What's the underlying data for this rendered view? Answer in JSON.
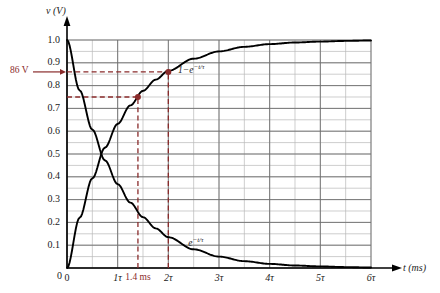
{
  "chart_data": {
    "type": "line",
    "title": "",
    "xlabel": "t (ms)",
    "ylabel": "v (V)",
    "xlim": [
      0,
      6
    ],
    "ylim": [
      0,
      1.0
    ],
    "grid": true,
    "grid_major_x": 1,
    "grid_minor_x": 0.5,
    "grid_major_y": 0.1,
    "grid_minor_y": 0.05,
    "x_unit": "tau",
    "xticks": [
      "0",
      "1τ",
      "2τ",
      "3τ",
      "4τ",
      "5τ",
      "6τ"
    ],
    "xtick_values": [
      0,
      1,
      2,
      3,
      4,
      5,
      6
    ],
    "yticks": [
      "0",
      "0.1",
      "0.2",
      "0.3",
      "0.4",
      "0.5",
      "0.6",
      "0.7",
      "0.8",
      "0.9",
      "1.0"
    ],
    "ytick_values": [
      0,
      0.1,
      0.2,
      0.3,
      0.4,
      0.5,
      0.6,
      0.7,
      0.8,
      0.9,
      1.0
    ],
    "legend_position": "inline-annotation",
    "series": [
      {
        "name": "1 - e^(-t/tau)",
        "label": "1−e",
        "label_exponent": "−t/τ",
        "label_x": 2.35,
        "label_y": 0.875,
        "formula": "1 - exp(-t/tau)",
        "x": [
          0,
          0.25,
          0.5,
          0.75,
          1,
          1.25,
          1.5,
          1.75,
          2,
          2.5,
          3,
          3.5,
          4,
          4.5,
          5,
          5.5,
          6
        ],
        "values": [
          0,
          0.221,
          0.393,
          0.528,
          0.632,
          0.713,
          0.777,
          0.826,
          0.865,
          0.918,
          0.95,
          0.97,
          0.982,
          0.989,
          0.993,
          0.996,
          0.998
        ]
      },
      {
        "name": "e^(-t/tau)",
        "label": "e",
        "label_exponent": "−t/τ",
        "label_x": 2.55,
        "label_y": 0.115,
        "formula": "exp(-t/tau)",
        "x": [
          0,
          0.25,
          0.5,
          0.75,
          1,
          1.25,
          1.5,
          1.75,
          2,
          2.5,
          3,
          3.5,
          4,
          4.5,
          5,
          5.5,
          6
        ],
        "values": [
          1,
          0.779,
          0.607,
          0.472,
          0.368,
          0.287,
          0.223,
          0.174,
          0.135,
          0.082,
          0.05,
          0.03,
          0.018,
          0.011,
          0.007,
          0.004,
          0.002
        ]
      }
    ],
    "markers": [
      {
        "name": "point-1.4ms",
        "x": 1.4,
        "y": 0.75,
        "color": "#8a2b2b"
      },
      {
        "name": "point-2tau",
        "x": 2.0,
        "y": 0.86,
        "color": "#8a2b2b"
      }
    ],
    "guide_lines": [
      {
        "name": "guide-h-0.86",
        "orientation": "horizontal",
        "value": 0.86,
        "from": 0,
        "to": 2.0,
        "style": "dashed",
        "color": "#8a2b2b"
      },
      {
        "name": "guide-h-0.75",
        "orientation": "horizontal",
        "value": 0.75,
        "from": 0,
        "to": 1.4,
        "style": "dashed",
        "color": "#8a2b2b"
      },
      {
        "name": "guide-v-1.4ms",
        "orientation": "vertical",
        "value": 1.4,
        "from": 0,
        "to": 0.75,
        "style": "dashed",
        "color": "#8a2b2b"
      },
      {
        "name": "guide-v-2tau",
        "orientation": "vertical",
        "value": 2.0,
        "from": 0,
        "to": 0.86,
        "style": "dashed",
        "color": "#8a2b2b"
      }
    ],
    "annotations": [
      {
        "name": "callout-86v",
        "text": "86 V",
        "x": -1.15,
        "y": 0.86,
        "color": "#8a2b2b",
        "arrow": true
      },
      {
        "name": "xtick-1.4ms",
        "text": "1.4 ms",
        "x": 1.4,
        "y": 0,
        "color": "#8a2b2b"
      }
    ],
    "colors": {
      "curve": "#000000",
      "grid_major": "#6e6e6e",
      "grid_minor": "#b9b9b9",
      "axis": "#000000",
      "accent": "#8a2b2b"
    }
  },
  "labels": {
    "y_axis": "v (V)",
    "y_axis_var": "v",
    "y_axis_unit": "(V)",
    "x_axis": "t (ms)",
    "x_axis_var": "t",
    "x_axis_unit": "(ms)",
    "callout_86v": "86 V",
    "tick_1_4ms": "1.4 ms",
    "curve_rising_base": "1−e",
    "curve_rising_exp": "−t/τ",
    "curve_falling_base": "e",
    "curve_falling_exp": "−t/τ"
  }
}
